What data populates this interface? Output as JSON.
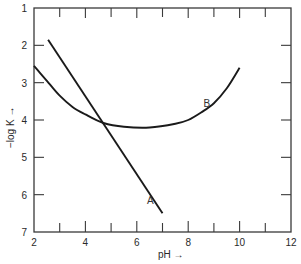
{
  "chart_data": {
    "type": "line",
    "title": "",
    "xlabel": "pH →",
    "ylabel": "−log K →",
    "xlim": [
      2,
      12
    ],
    "ylim": [
      7,
      1
    ],
    "y_inverted": true,
    "grid": false,
    "legend": "none (curves labeled inline)",
    "x_ticks": [
      2,
      3,
      4,
      5,
      6,
      7,
      8,
      9,
      10,
      11,
      12
    ],
    "x_tick_labels": [
      "2",
      "4",
      "6",
      "8",
      "10",
      "12"
    ],
    "y_ticks": [
      1,
      2,
      3,
      4,
      5,
      6,
      7
    ],
    "y_tick_labels": [
      "1",
      "2",
      "3",
      "4",
      "5",
      "6",
      "7"
    ],
    "series": [
      {
        "name": "A",
        "label_position": {
          "x": 6.4,
          "y": 6.15
        },
        "x": [
          2.55,
          7.0
        ],
        "y": [
          1.85,
          6.5
        ]
      },
      {
        "name": "B",
        "label_position": {
          "x": 8.6,
          "y": 3.55
        },
        "x": [
          2.0,
          2.5,
          3.0,
          3.5,
          4.0,
          4.7,
          5.5,
          6.5,
          7.5,
          8.0,
          8.5,
          9.0,
          9.5,
          10.0
        ],
        "y": [
          2.55,
          2.95,
          3.35,
          3.65,
          3.85,
          4.08,
          4.18,
          4.2,
          4.1,
          4.0,
          3.8,
          3.55,
          3.15,
          2.6
        ]
      }
    ],
    "annotations": [
      {
        "text": "A",
        "near": "lower end of straight line"
      },
      {
        "text": "B",
        "near": "right rising branch of U-shaped curve"
      }
    ],
    "intersection": {
      "x": 4.7,
      "y": 4.08
    }
  },
  "colors": {
    "line": "#1a1a1a",
    "axis": "#3a3a3a",
    "text": "#2a2a2a",
    "background": "#ffffff"
  }
}
